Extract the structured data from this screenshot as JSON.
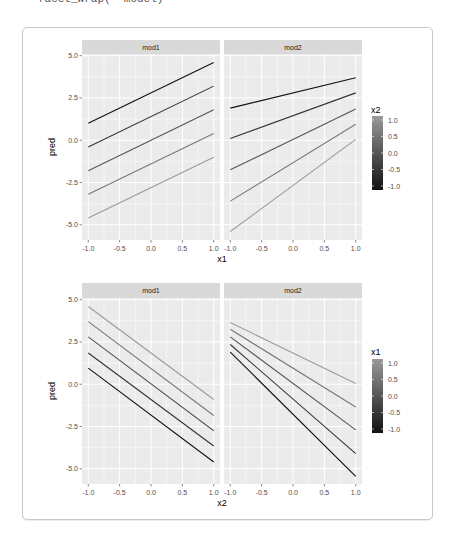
{
  "code_snippet": "facet_wrap(~ model)",
  "colors": {
    "panel_bg": "#ebebeb",
    "strip_bg": "#d9d9d9",
    "grid": "#ffffff",
    "low": "#132b43",
    "gradient_low": "#111111",
    "gradient_high": "#9a9a9a"
  },
  "chart_data": [
    {
      "type": "line",
      "title": "",
      "facets": [
        "mod1",
        "mod2"
      ],
      "xlabel": "x1",
      "ylabel": "pred",
      "xlim": [
        -1.1,
        1.1
      ],
      "ylim": [
        -5.9,
        5.1
      ],
      "xticks": [
        -1.0,
        -0.5,
        0.0,
        0.5,
        1.0
      ],
      "xtick_labels": [
        "-1.0",
        "-0.5",
        "0.0",
        "0.5",
        "1.0"
      ],
      "yticks": [
        5.0,
        2.5,
        0.0,
        -2.5,
        -5.0
      ],
      "ytick_labels": [
        "5.0",
        "2.5",
        "0.0",
        "-2.5",
        "-5.0"
      ],
      "grid": true,
      "legend": {
        "title": "x2",
        "position": "right",
        "type": "colorbar",
        "labels": [
          "1.0",
          "0.5",
          "0.0",
          "-0.5",
          "-1.0"
        ],
        "range": [
          -1,
          1
        ]
      },
      "x": [
        -1.0,
        1.0
      ],
      "panels": {
        "mod1": [
          {
            "name": "x2=-1.0",
            "color_value": -1.0,
            "values": [
              1.0,
              4.6
            ]
          },
          {
            "name": "x2=-0.5",
            "color_value": -0.5,
            "values": [
              -0.4,
              3.2
            ]
          },
          {
            "name": "x2=0.0",
            "color_value": 0.0,
            "values": [
              -1.8,
              1.8
            ]
          },
          {
            "name": "x2=0.5",
            "color_value": 0.5,
            "values": [
              -3.2,
              0.4
            ]
          },
          {
            "name": "x2=1.0",
            "color_value": 1.0,
            "values": [
              -4.6,
              -1.0
            ]
          }
        ],
        "mod2": [
          {
            "name": "x2=-1.0",
            "color_value": -1.0,
            "values": [
              1.9,
              3.7
            ]
          },
          {
            "name": "x2=-0.5",
            "color_value": -0.5,
            "values": [
              0.1,
              2.8
            ]
          },
          {
            "name": "x2=0.0",
            "color_value": 0.0,
            "values": [
              -1.75,
              1.85
            ]
          },
          {
            "name": "x2=0.5",
            "color_value": 0.5,
            "values": [
              -3.6,
              0.95
            ]
          },
          {
            "name": "x2=1.0",
            "color_value": 1.0,
            "values": [
              -5.4,
              0.05
            ]
          }
        ]
      }
    },
    {
      "type": "line",
      "title": "",
      "facets": [
        "mod1",
        "mod2"
      ],
      "xlabel": "x2",
      "ylabel": "pred",
      "xlim": [
        -1.1,
        1.1
      ],
      "ylim": [
        -5.9,
        5.1
      ],
      "xticks": [
        -1.0,
        -0.5,
        0.0,
        0.5,
        1.0
      ],
      "xtick_labels": [
        "-1.0",
        "-0.5",
        "0.0",
        "0.5",
        "1.0"
      ],
      "yticks": [
        5.0,
        2.5,
        0.0,
        -2.5,
        -5.0
      ],
      "ytick_labels": [
        "5.0",
        "2.5",
        "0.0",
        "-2.5",
        "-5.0"
      ],
      "grid": true,
      "legend": {
        "title": "x1",
        "position": "right",
        "type": "colorbar",
        "labels": [
          "1.0",
          "0.5",
          "0.0",
          "-0.5",
          "-1.0"
        ],
        "range": [
          -1,
          1
        ]
      },
      "x": [
        -1.0,
        1.0
      ],
      "panels": {
        "mod1": [
          {
            "name": "x1=1.0",
            "color_value": 1.0,
            "values": [
              4.6,
              -0.9
            ]
          },
          {
            "name": "x1=0.5",
            "color_value": 0.5,
            "values": [
              3.7,
              -1.85
            ]
          },
          {
            "name": "x1=0.0",
            "color_value": 0.0,
            "values": [
              2.8,
              -2.75
            ]
          },
          {
            "name": "x1=-0.5",
            "color_value": -0.5,
            "values": [
              1.85,
              -3.65
            ]
          },
          {
            "name": "x1=-1.0",
            "color_value": -1.0,
            "values": [
              0.95,
              -4.6
            ]
          }
        ],
        "mod2": [
          {
            "name": "x1=1.0",
            "color_value": 1.0,
            "values": [
              3.65,
              0.05
            ]
          },
          {
            "name": "x1=0.5",
            "color_value": 0.5,
            "values": [
              3.25,
              -1.35
            ]
          },
          {
            "name": "x1=0.0",
            "color_value": 0.0,
            "values": [
              2.8,
              -2.7
            ]
          },
          {
            "name": "x1=-0.5",
            "color_value": -0.5,
            "values": [
              2.35,
              -4.1
            ]
          },
          {
            "name": "x1=-1.0",
            "color_value": -1.0,
            "values": [
              1.9,
              -5.45
            ]
          }
        ]
      }
    }
  ]
}
